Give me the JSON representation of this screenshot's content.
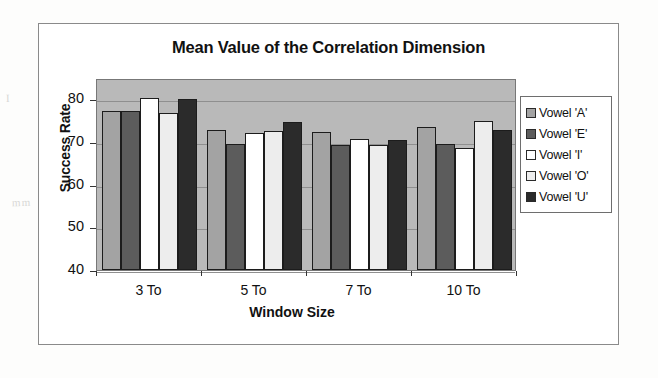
{
  "figure": {
    "title": "Mean Value of the Correlation Dimension"
  },
  "legend": {
    "position": "right",
    "items": [
      {
        "label": "Vowel 'A'",
        "color": "#a3a3a3",
        "swatch_name": "legend-swatch-vowel-a"
      },
      {
        "label": "Vowel 'E'",
        "color": "#5c5c5c",
        "swatch_name": "legend-swatch-vowel-e"
      },
      {
        "label": "Vowel  'I'",
        "color": "#ffffff",
        "swatch_name": "legend-swatch-vowel-i"
      },
      {
        "label": "Vowel 'O'",
        "color": "#ededed",
        "swatch_name": "legend-swatch-vowel-o"
      },
      {
        "label": "Vowel 'U'",
        "color": "#2b2b2b",
        "swatch_name": "legend-swatch-vowel-u"
      }
    ]
  },
  "axes": {
    "y_ticks": [
      "80",
      "70",
      "60",
      "50",
      "40"
    ],
    "x_ticks": [
      "3 To",
      "5 To",
      "7 To",
      "10 To"
    ]
  },
  "chart_data": {
    "type": "bar",
    "title": "Mean Value of the Correlation Dimension",
    "xlabel": "Window Size",
    "ylabel": "Success Rate",
    "categories": [
      "3 To",
      "5 To",
      "7 To",
      "10 To"
    ],
    "ylim": [
      40,
      85
    ],
    "yticks": [
      40,
      50,
      60,
      70,
      80
    ],
    "grid": true,
    "legend_position": "right",
    "plot_background": "#b9b9b9",
    "series": [
      {
        "name": "Vowel 'A'",
        "color": "#a3a3a3",
        "values": [
          77.2,
          72.9,
          72.4,
          73.5
        ]
      },
      {
        "name": "Vowel 'E'",
        "color": "#5c5c5c",
        "values": [
          77.2,
          69.5,
          69.2,
          69.6
        ]
      },
      {
        "name": "Vowel  'I'",
        "color": "#ffffff",
        "values": [
          80.2,
          72.0,
          70.8,
          68.6
        ]
      },
      {
        "name": "Vowel 'O'",
        "color": "#ededed",
        "values": [
          76.8,
          72.5,
          69.4,
          75.0
        ]
      },
      {
        "name": "Vowel 'U'",
        "color": "#2b2b2b",
        "values": [
          80.0,
          74.6,
          70.5,
          72.8
        ]
      }
    ]
  }
}
